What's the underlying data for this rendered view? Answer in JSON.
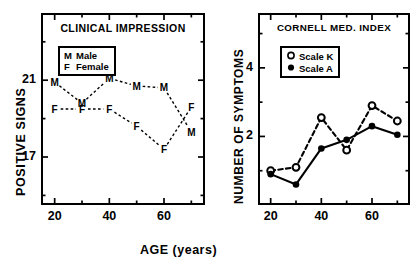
{
  "figure": {
    "xaxis_title": "AGE  (years)"
  },
  "chart_data": [
    {
      "type": "line",
      "id": "clinical-impression",
      "title": "CLINICAL IMPRESSION",
      "xlabel": "AGE (years)",
      "ylabel": "POSITIVE SIGNS",
      "xlim": [
        15,
        75
      ],
      "ylim": [
        14.5,
        24.5
      ],
      "xticks": [
        20,
        40,
        60
      ],
      "xminorticks": [
        30,
        50,
        70
      ],
      "yticks": [
        21,
        17
      ],
      "yminorticks": [
        19,
        23,
        15
      ],
      "grid": false,
      "legend_position": "upper-left",
      "marker_style": "text-letter",
      "line_style": "dashed",
      "x": [
        20,
        30,
        40,
        50,
        60,
        70
      ],
      "series": [
        {
          "name": "Male",
          "key": "M",
          "values": [
            20.9,
            19.8,
            21.1,
            20.7,
            20.6,
            18.3
          ]
        },
        {
          "name": "Female",
          "key": "F",
          "values": [
            19.5,
            19.5,
            19.5,
            18.6,
            17.4,
            19.6
          ]
        }
      ],
      "legend": [
        {
          "key": "M",
          "label": "Male"
        },
        {
          "key": "F",
          "label": "Female"
        }
      ]
    },
    {
      "type": "line",
      "id": "cornell-med-index",
      "title": "CORNELL  MED. INDEX",
      "xlabel": "AGE (years)",
      "ylabel": "NUMBER OF SYMPTOMS",
      "xlim": [
        15,
        75
      ],
      "ylim": [
        0,
        5.6
      ],
      "xticks": [
        20,
        40,
        60
      ],
      "xminorticks": [
        30,
        50,
        70
      ],
      "yticks": [
        4,
        2
      ],
      "yminorticks": [
        5,
        3,
        1
      ],
      "grid": false,
      "legend_position": "upper-left",
      "x": [
        20,
        30,
        40,
        50,
        60,
        70
      ],
      "series": [
        {
          "name": "Scale K",
          "marker": "open-circle",
          "line_style": "dashed",
          "values": [
            1.0,
            1.1,
            2.55,
            1.6,
            2.9,
            2.45
          ]
        },
        {
          "name": "Scale A",
          "marker": "filled-circle",
          "line_style": "solid",
          "values": [
            0.9,
            0.6,
            1.65,
            1.9,
            2.3,
            2.05
          ]
        }
      ],
      "legend": [
        {
          "marker": "open-circle",
          "label": "Scale K"
        },
        {
          "marker": "filled-circle",
          "label": "Scale A"
        }
      ]
    }
  ]
}
